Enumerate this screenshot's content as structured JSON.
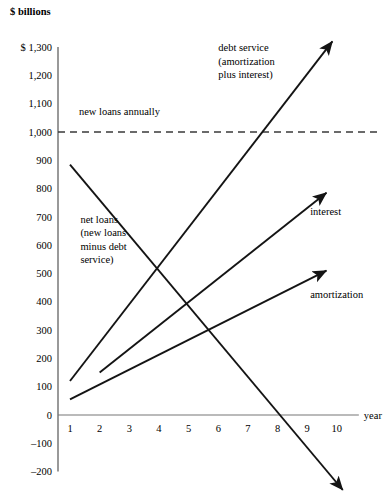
{
  "chart_data": {
    "type": "line",
    "title": "",
    "ylabel": "$ billions",
    "xlabel": "year",
    "ylim": [
      -200,
      1300
    ],
    "xlim": [
      0.4,
      10.6
    ],
    "grid": false,
    "legend_position": "inline-annotations",
    "y_ticks": [
      "$ 1,300",
      "1,200",
      "1,100",
      "1,000",
      "900",
      "800",
      "700",
      "600",
      "500",
      "400",
      "300",
      "200",
      "100",
      "0",
      "–100",
      "–200"
    ],
    "y_tick_values": [
      1300,
      1200,
      1100,
      1000,
      900,
      800,
      700,
      600,
      500,
      400,
      300,
      200,
      100,
      0,
      -100,
      -200
    ],
    "x_ticks": [
      "1",
      "2",
      "3",
      "4",
      "5",
      "6",
      "7",
      "8",
      "9",
      "10"
    ],
    "x_tick_values": [
      1,
      2,
      3,
      4,
      5,
      6,
      7,
      8,
      9,
      10
    ],
    "reference_line": {
      "label": "new loans annually",
      "value": 1000,
      "style": "dashed",
      "label_x": 1.3,
      "label_y": 1060
    },
    "series": [
      {
        "name": "debt service (amortization plus interest)",
        "label_lines": [
          "debt service",
          "(amortization",
          "plus interest)"
        ],
        "label_x": 6.0,
        "label_y": 1285,
        "arrow": true,
        "x": [
          1,
          9.85
        ],
        "values": [
          120,
          1320
        ]
      },
      {
        "name": "interest",
        "label_lines": [
          "interest"
        ],
        "label_x": 9.1,
        "label_y": 705,
        "arrow": true,
        "x": [
          2,
          9.65
        ],
        "values": [
          150,
          785
        ]
      },
      {
        "name": "amortization",
        "label_lines": [
          "amortization"
        ],
        "label_x": 9.1,
        "label_y": 415,
        "arrow": true,
        "x": [
          1,
          9.65
        ],
        "values": [
          55,
          510
        ]
      },
      {
        "name": "net loans (new loans minus debt service)",
        "label_lines": [
          "net loans",
          "(new loans",
          "minus debt",
          "service)"
        ],
        "label_x": 1.35,
        "label_y": 680,
        "arrow": true,
        "x": [
          1,
          10.2
        ],
        "values": [
          885,
          -265
        ]
      }
    ]
  },
  "axis_labels": {
    "y_unit": "$ billions",
    "x_name": "year"
  }
}
